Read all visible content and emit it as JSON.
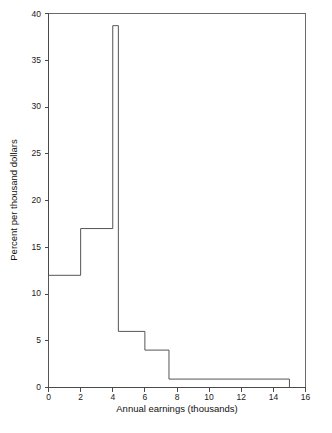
{
  "chart_data": {
    "type": "bar",
    "title": "",
    "subtitle": "",
    "xlabel": "Annual earnings (thousands)",
    "ylabel": "Percent per thousand dollars",
    "xlim": [
      0,
      16
    ],
    "ylim": [
      0,
      40
    ],
    "grid": false,
    "legend": null,
    "xticks": [
      0,
      2,
      4,
      6,
      8,
      10,
      12,
      14,
      16
    ],
    "xtick_labels": [
      "0",
      "2",
      "4",
      "6",
      "8",
      "10",
      "12",
      "14",
      "16"
    ],
    "yticks": [
      0,
      5,
      10,
      15,
      20,
      25,
      30,
      35,
      40
    ],
    "ytick_labels": [
      "0",
      "5",
      "10",
      "15",
      "20",
      "25",
      "30",
      "35",
      "40"
    ],
    "bins": [
      {
        "x0": 0,
        "x1": 2,
        "height": 12
      },
      {
        "x0": 2,
        "x1": 4,
        "height": 17
      },
      {
        "x0": 4,
        "x1": 4.35,
        "height": 38.7
      },
      {
        "x0": 4.35,
        "x1": 6,
        "height": 6
      },
      {
        "x0": 6,
        "x1": 7.5,
        "height": 4
      },
      {
        "x0": 7.5,
        "x1": 15,
        "height": 0.9
      }
    ],
    "categories": [
      "0-2",
      "2-4",
      "4-4.35",
      "4.35-6",
      "6-7.5",
      "7.5-15"
    ],
    "values": [
      12,
      17,
      38.7,
      6,
      4,
      0.9
    ],
    "line_color": "#555555",
    "axis_color": "#4a4a4a",
    "background_color": "#ffffff"
  },
  "figure": {
    "caption": ""
  }
}
